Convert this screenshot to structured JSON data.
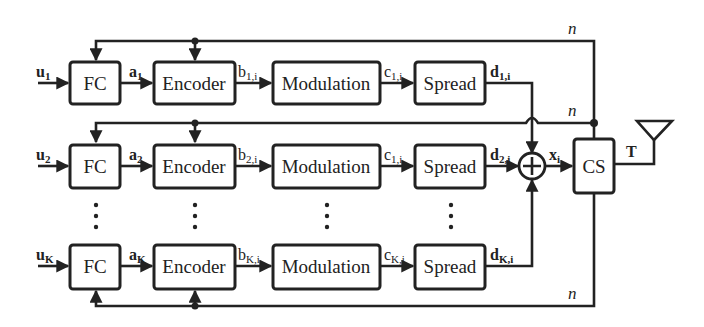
{
  "diagram": {
    "rows": [
      {
        "input": {
          "main": "u",
          "sub": "1"
        },
        "fc_label": "FC",
        "fc_out": {
          "main": "a",
          "sub": "1"
        },
        "encoder_label": "Encoder",
        "enc_out": {
          "main": "b",
          "sub": "1,i"
        },
        "modulation_label": "Modulation",
        "mod_out": {
          "main": "c",
          "sub": "1,i"
        },
        "spread_label": "Spread",
        "spread_out": {
          "main": "d",
          "sub": "1,i"
        }
      },
      {
        "input": {
          "main": "u",
          "sub": "2"
        },
        "fc_label": "FC",
        "fc_out": {
          "main": "a",
          "sub": "2"
        },
        "encoder_label": "Encoder",
        "enc_out": {
          "main": "b",
          "sub": "2,i"
        },
        "modulation_label": "Modulation",
        "mod_out": {
          "main": "c",
          "sub": "1,i"
        },
        "spread_label": "Spread",
        "spread_out": {
          "main": "d",
          "sub": "2,i"
        }
      },
      {
        "input": {
          "main": "u",
          "sub": "K"
        },
        "fc_label": "FC",
        "fc_out": {
          "main": "a",
          "sub": "K"
        },
        "encoder_label": "Encoder",
        "enc_out": {
          "main": "b",
          "sub": "K,i"
        },
        "modulation_label": "Modulation",
        "mod_out": {
          "main": "c",
          "sub": "K,i"
        },
        "spread_label": "Spread",
        "spread_out": {
          "main": "d",
          "sub": "K,i"
        }
      }
    ],
    "sum_symbol": "+",
    "sum_out": {
      "main": "x",
      "sub": "i"
    },
    "cs_label": "CS",
    "cs_out": "T",
    "feedback_label": "n",
    "ellipsis": "⋮"
  }
}
